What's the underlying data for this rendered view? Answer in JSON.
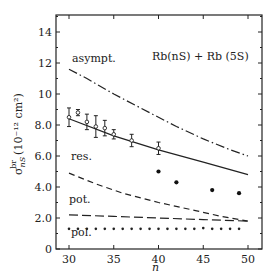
{
  "chart_data": {
    "type": "line",
    "title": "",
    "annotation_title": "Rb(nS) + Rb (5S)",
    "xlabel": "n",
    "ylabel": "σ^br_nS (10^-12 cm^2)",
    "xlim": [
      28,
      52
    ],
    "ylim": [
      0,
      15
    ],
    "x_ticks": [
      30,
      35,
      40,
      45,
      50
    ],
    "x_tick_labels": [
      "30",
      "35",
      "40",
      "45",
      "50"
    ],
    "y_ticks": [
      0,
      2,
      4,
      6,
      8,
      10,
      12,
      14
    ],
    "y_tick_labels": [
      "0",
      "2.0",
      "4.0",
      "6.0",
      "8.0",
      "10",
      "12",
      "14"
    ],
    "grid": false,
    "legend": "inline labels",
    "series": [
      {
        "name": "asympt.",
        "style": "dash-dot",
        "x": [
          30,
          32,
          35,
          38,
          40,
          42,
          45,
          48,
          50
        ],
        "values": [
          11.6,
          11.0,
          10.0,
          9.1,
          8.5,
          7.9,
          7.1,
          6.4,
          6.0
        ]
      },
      {
        "name": "res. (solid)",
        "style": "solid",
        "x": [
          30,
          35,
          40,
          45,
          50
        ],
        "values": [
          8.4,
          7.3,
          6.4,
          5.6,
          4.8
        ]
      },
      {
        "name": "res.",
        "style": "dashed",
        "x": [
          30,
          33,
          36,
          40,
          44,
          47,
          50
        ],
        "values": [
          4.9,
          4.2,
          3.6,
          3.0,
          2.5,
          2.1,
          1.8
        ]
      },
      {
        "name": "pot.",
        "style": "long-dash",
        "x": [
          30,
          35,
          40,
          45,
          50
        ],
        "values": [
          2.2,
          2.1,
          2.0,
          1.9,
          1.8
        ]
      },
      {
        "name": "pol.",
        "style": "dotted",
        "x": [
          30,
          31,
          32,
          33,
          34,
          35,
          36,
          37,
          38,
          39,
          40,
          41,
          42,
          43,
          44,
          45,
          46,
          47,
          48,
          49
        ],
        "values": [
          1.3,
          1.3,
          1.3,
          1.3,
          1.3,
          1.3,
          1.3,
          1.3,
          1.3,
          1.3,
          1.3,
          1.3,
          1.3,
          1.3,
          1.3,
          1.35,
          1.3,
          1.3,
          1.3,
          1.3
        ]
      },
      {
        "name": "experiment (open, error bars)",
        "style": "markers-errorbar",
        "x": [
          30,
          31,
          32,
          33,
          34,
          35,
          37,
          40
        ],
        "values": [
          8.5,
          8.8,
          8.2,
          7.9,
          7.8,
          7.4,
          7.0,
          6.5
        ],
        "errors": [
          0.6,
          0.2,
          0.5,
          0.7,
          0.5,
          0.3,
          0.4,
          0.4
        ]
      },
      {
        "name": "experiment (filled)",
        "style": "markers-filled",
        "x": [
          40,
          42,
          46,
          49
        ],
        "values": [
          5.0,
          4.3,
          3.8,
          3.6
        ]
      }
    ]
  },
  "labels": {
    "asympt": "asympt.",
    "res": "res.",
    "pot": "pot.",
    "pol": "pol.",
    "title": "Rb(nS) + Rb (5S)",
    "xlabel": "n",
    "ylabel_sigma": "σ",
    "ylabel_sup": "br",
    "ylabel_sub": "nS",
    "ylabel_units": "(10⁻¹² cm²)"
  }
}
